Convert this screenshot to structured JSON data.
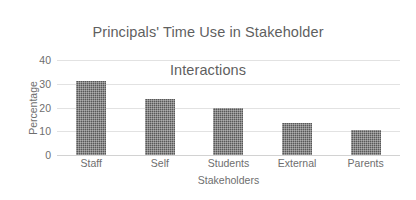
{
  "chart_data": {
    "type": "bar",
    "title": "Principals' Time Use in Stakeholder Interactions",
    "title_line1": "Principals' Time Use in Stakeholder",
    "title_line2": "Interactions",
    "xlabel": "Stakeholders",
    "ylabel": "Percentage",
    "categories": [
      "Staff",
      "Self",
      "Students",
      "External",
      "Parents"
    ],
    "values": [
      31,
      23.5,
      20,
      13.5,
      10.5
    ],
    "ylim": [
      0,
      40
    ],
    "yticks": [
      40,
      30,
      20,
      10,
      0
    ],
    "grid": true,
    "legend": "none",
    "bar_color": "#585858",
    "bar_pattern": "dotted-checker",
    "text_color": "#6e6e6e",
    "title_color": "#5f5f5f",
    "gridline_color": "#e2e2e2"
  }
}
